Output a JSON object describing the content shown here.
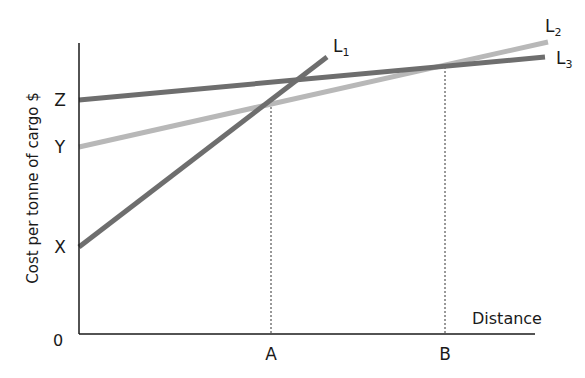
{
  "chart_data": {
    "type": "line",
    "title": "",
    "xlabel": "Distance",
    "ylabel": "Cost per tonne of cargo $",
    "origin_label": "0",
    "x_ticks": [
      {
        "label": "A",
        "px": 271
      },
      {
        "label": "B",
        "px": 445
      }
    ],
    "y_ticks": [
      {
        "label": "Z",
        "px": 100
      },
      {
        "label": "Y",
        "px": 147
      },
      {
        "label": "X",
        "px": 247
      }
    ],
    "grid": false,
    "legend": "inline line labels",
    "series": [
      {
        "name": "L1",
        "label_main": "L",
        "label_sub": "1",
        "color": "#6e6e6e",
        "start_intercept": "X",
        "points": [
          [
            79,
            247
          ],
          [
            327,
            57
          ]
        ],
        "label_pos": [
          333,
          52
        ]
      },
      {
        "name": "L2",
        "label_main": "L",
        "label_sub": "2",
        "color": "#b8b8b8",
        "start_intercept": "Y",
        "points": [
          [
            79,
            147
          ],
          [
            548,
            42
          ]
        ],
        "label_pos": [
          545,
          32
        ]
      },
      {
        "name": "L3",
        "label_main": "L",
        "label_sub": "3",
        "color": "#6e6e6e",
        "start_intercept": "Z",
        "points": [
          [
            79,
            100
          ],
          [
            545,
            57
          ]
        ],
        "label_pos": [
          556,
          64
        ]
      }
    ],
    "annotations": [
      {
        "text": "A marks L1 = L2 crossover distance",
        "x_px": 271,
        "y_px": 103
      },
      {
        "text": "B marks L2 = L3 crossover distance",
        "x_px": 445,
        "y_px": 67
      }
    ]
  },
  "axes": {
    "x_axis": {
      "x1": 79,
      "x2": 535,
      "y": 334
    },
    "y_axis": {
      "x": 79,
      "y1": 43,
      "y2": 334
    }
  }
}
